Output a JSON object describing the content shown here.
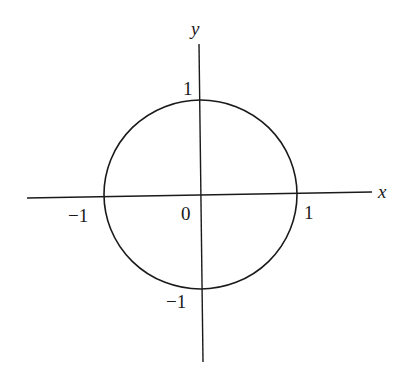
{
  "figure": {
    "axes": {
      "x_label": "x",
      "y_label": "y"
    },
    "ticks": {
      "x_neg": "−1",
      "origin": "0",
      "x_pos": "1",
      "y_pos": "1",
      "y_neg": "−1"
    },
    "circle": {
      "center": [
        0,
        0
      ],
      "radius": 1
    },
    "colors": {
      "stroke": "#1a1a1a",
      "background": "#ffffff"
    }
  }
}
